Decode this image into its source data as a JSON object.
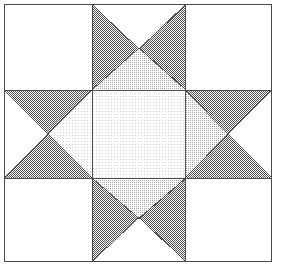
{
  "figure": {
    "kind": "quilt-block-diagram",
    "canvas": {
      "width": 282,
      "height": 271
    },
    "background_color": "#ffffff"
  },
  "frame": {
    "name": "outer-frame",
    "x": 4.5,
    "y": 4.5,
    "width": 267,
    "height": 257,
    "stroke_color": "#4a4a4a",
    "stroke_width": 1.6,
    "fill": "none"
  },
  "grid": {
    "columns_x": [
      4.5,
      92,
      185,
      271.5
    ],
    "rows_y": [
      4.5,
      90,
      178,
      261.5
    ],
    "center_x": 138.5,
    "center_y": 134,
    "line_color": "#555555",
    "line_width": 0.9
  },
  "palette": {
    "white": "#ffffff",
    "very_light": "#f2f2f2",
    "light": "#e0e0e0",
    "medium_light": "#d2d2d2",
    "dark": "#8c8c8c",
    "outline": "#3d3d3d",
    "frame": "#4a4a4a"
  },
  "fills": {
    "dark_dither": {
      "name": "dark-50-dither",
      "density": "50%",
      "dot_color": "#4f4f4f",
      "base": "#ffffff"
    },
    "medium_dither": {
      "name": "medium-25-dither",
      "density": "25%",
      "dot_color": "#9a9a9a",
      "base": "#ffffff"
    },
    "light_dither": {
      "name": "light-12-dither",
      "density": "12%",
      "dot_color": "#c9c9c9",
      "base": "#ffffff"
    },
    "plain_white": {
      "name": "plain-white",
      "density": "0%",
      "dot_color": "none",
      "base": "#ffffff"
    }
  },
  "shapes": {
    "corner_squares": [
      {
        "name": "corner-top-left",
        "points": "4.5,4.5 92,4.5 92,90 4.5,90",
        "fill": "plain_white"
      },
      {
        "name": "corner-top-right",
        "points": "185,4.5 271.5,4.5 271.5,90 185,90",
        "fill": "plain_white"
      },
      {
        "name": "corner-bottom-left",
        "points": "4.5,178 92,178 92,261.5 4.5,261.5",
        "fill": "plain_white"
      },
      {
        "name": "corner-bottom-right",
        "points": "185,178 271.5,178 271.5,261.5 185,261.5",
        "fill": "plain_white"
      }
    ],
    "star_point_triangles": [
      {
        "name": "star-point-top-left-dark",
        "points": "92,4.5 138.5,48.5 92,90",
        "fill": "dark_dither"
      },
      {
        "name": "star-point-top-right-dark",
        "points": "185,4.5 185,90 138.5,48.5",
        "fill": "dark_dither"
      },
      {
        "name": "star-point-top-center-light",
        "points": "92,90 138.5,48.5 185,90",
        "fill": "medium_dither"
      },
      {
        "name": "star-point-bottom-left-dark",
        "points": "92,178 138.5,218 92,261.5",
        "fill": "dark_dither"
      },
      {
        "name": "star-point-bottom-right-dark",
        "points": "185,178 185,261.5 138.5,218",
        "fill": "dark_dither"
      },
      {
        "name": "star-point-bottom-center-light",
        "points": "92,178 138.5,218 185,178",
        "fill": "medium_dither"
      },
      {
        "name": "star-point-left-top-dark",
        "points": "4.5,90 48,134 92,90",
        "fill": "dark_dither"
      },
      {
        "name": "star-point-left-bottom-dark",
        "points": "4.5,178 48,134 92,178",
        "fill": "dark_dither"
      },
      {
        "name": "star-point-left-center-light",
        "points": "48,134 92,90 92,178",
        "fill": "light_dither"
      },
      {
        "name": "star-point-right-top-dark",
        "points": "271.5,90 228,134 185,90",
        "fill": "dark_dither"
      },
      {
        "name": "star-point-right-bottom-dark",
        "points": "271.5,178 228,134 185,178",
        "fill": "dark_dither"
      },
      {
        "name": "star-point-right-center-light",
        "points": "228,134 185,90 185,178",
        "fill": "medium_dither"
      }
    ],
    "center_square": {
      "name": "center-square",
      "points": "92,90 185,90 185,178 92,178",
      "fill": "light_dither"
    }
  },
  "outlines": [
    {
      "name": "outline-top-left-diagonal",
      "x1": 92,
      "y1": 4.5,
      "x2": 138.5,
      "y2": 48.5
    },
    {
      "name": "outline-top-right-diagonal",
      "x1": 185,
      "y1": 4.5,
      "x2": 138.5,
      "y2": 48.5
    },
    {
      "name": "outline-top-left-lower",
      "x1": 92,
      "y1": 90,
      "x2": 138.5,
      "y2": 48.5
    },
    {
      "name": "outline-top-right-lower",
      "x1": 185,
      "y1": 90,
      "x2": 138.5,
      "y2": 48.5
    },
    {
      "name": "outline-bottom-left-diagonal",
      "x1": 92,
      "y1": 261.5,
      "x2": 138.5,
      "y2": 218
    },
    {
      "name": "outline-bottom-right-diagonal",
      "x1": 185,
      "y1": 261.5,
      "x2": 138.5,
      "y2": 218
    },
    {
      "name": "outline-bottom-left-upper",
      "x1": 92,
      "y1": 178,
      "x2": 138.5,
      "y2": 218
    },
    {
      "name": "outline-bottom-right-upper",
      "x1": 185,
      "y1": 178,
      "x2": 138.5,
      "y2": 218
    },
    {
      "name": "outline-left-top-diagonal",
      "x1": 4.5,
      "y1": 90,
      "x2": 48,
      "y2": 134
    },
    {
      "name": "outline-left-bottom-diagonal",
      "x1": 4.5,
      "y1": 178,
      "x2": 48,
      "y2": 134
    },
    {
      "name": "outline-left-top-inner",
      "x1": 92,
      "y1": 90,
      "x2": 48,
      "y2": 134
    },
    {
      "name": "outline-left-bottom-inner",
      "x1": 92,
      "y1": 178,
      "x2": 48,
      "y2": 134
    },
    {
      "name": "outline-right-top-diagonal",
      "x1": 271.5,
      "y1": 90,
      "x2": 228,
      "y2": 134
    },
    {
      "name": "outline-right-bottom-diagonal",
      "x1": 271.5,
      "y1": 178,
      "x2": 228,
      "y2": 134
    },
    {
      "name": "outline-right-top-inner",
      "x1": 185,
      "y1": 90,
      "x2": 228,
      "y2": 134
    },
    {
      "name": "outline-right-bottom-inner",
      "x1": 185,
      "y1": 178,
      "x2": 228,
      "y2": 134
    },
    {
      "name": "outline-center-top",
      "x1": 92,
      "y1": 90,
      "x2": 185,
      "y2": 90
    },
    {
      "name": "outline-center-bottom",
      "x1": 92,
      "y1": 178,
      "x2": 185,
      "y2": 178
    },
    {
      "name": "outline-center-left",
      "x1": 92,
      "y1": 90,
      "x2": 92,
      "y2": 178
    },
    {
      "name": "outline-center-right",
      "x1": 185,
      "y1": 90,
      "x2": 185,
      "y2": 178
    },
    {
      "name": "outline-grid-vertical-left-top",
      "x1": 92,
      "y1": 4.5,
      "x2": 92,
      "y2": 90
    },
    {
      "name": "outline-grid-vertical-right-top",
      "x1": 185,
      "y1": 4.5,
      "x2": 185,
      "y2": 90
    },
    {
      "name": "outline-grid-vertical-left-bottom",
      "x1": 92,
      "y1": 178,
      "x2": 92,
      "y2": 261.5
    },
    {
      "name": "outline-grid-vertical-right-bottom",
      "x1": 185,
      "y1": 178,
      "x2": 185,
      "y2": 261.5
    },
    {
      "name": "outline-grid-horizontal-top-left",
      "x1": 4.5,
      "y1": 90,
      "x2": 92,
      "y2": 90
    },
    {
      "name": "outline-grid-horizontal-top-right",
      "x1": 185,
      "y1": 90,
      "x2": 271.5,
      "y2": 90
    },
    {
      "name": "outline-grid-horizontal-bot-left",
      "x1": 4.5,
      "y1": 178,
      "x2": 92,
      "y2": 178
    },
    {
      "name": "outline-grid-horizontal-bot-right",
      "x1": 185,
      "y1": 178,
      "x2": 271.5,
      "y2": 178
    }
  ]
}
